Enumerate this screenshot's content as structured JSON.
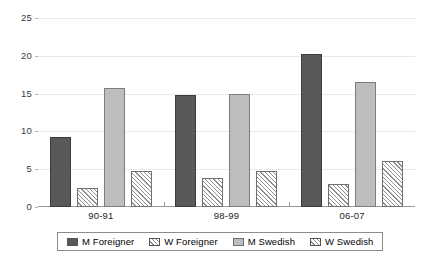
{
  "chart_data": {
    "type": "bar",
    "title": "",
    "subtitle": "",
    "xlabel": "",
    "ylabel": "",
    "categories": [
      "90-91",
      "98-99",
      "06-07"
    ],
    "series": [
      {
        "name": "M Foreigner",
        "values": [
          9.2,
          14.8,
          20.2
        ],
        "swatch": "solid-dark",
        "color": "#595959"
      },
      {
        "name": "W Foreigner",
        "values": [
          2.5,
          3.8,
          3.0
        ],
        "swatch": "hatch",
        "color": "#ffffff"
      },
      {
        "name": "M Swedish",
        "values": [
          15.7,
          15.0,
          16.6
        ],
        "swatch": "solid-light",
        "color": "#bdbdbd"
      },
      {
        "name": "W Swedish",
        "values": [
          4.7,
          4.7,
          6.1
        ],
        "swatch": "hatch",
        "color": "#ffffff"
      }
    ],
    "ylim": [
      0,
      25
    ],
    "yticks": [
      0,
      5,
      10,
      15,
      20,
      25
    ],
    "ytick_labels": [
      "0",
      "5",
      "10",
      "15",
      "20",
      "25"
    ],
    "grid": true,
    "grid_axis": "y",
    "legend_position": "bottom",
    "legend_entries": [
      "M Foreigner",
      "W Foreigner",
      "M Swedish",
      "W Swedish"
    ],
    "annotations": []
  }
}
